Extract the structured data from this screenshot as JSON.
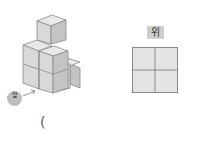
{
  "figure": {
    "stack_view": {
      "front_label": "앞",
      "arrow": "arrow-icon"
    },
    "top_view": {
      "label": "위",
      "grid": {
        "rows": 2,
        "cols": 2
      }
    },
    "answer_paren": "("
  },
  "colors": {
    "cube_top": "#e9e9e9",
    "cube_front": "#d9d9d9",
    "cube_side": "#c4c4c4",
    "edge": "#8a8a8a",
    "grid_fill": "#e4e4e4",
    "grid_line": "#8a8a8a"
  }
}
